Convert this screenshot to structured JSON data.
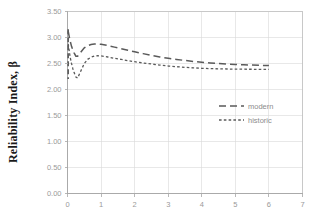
{
  "chart_data": {
    "type": "line",
    "title": "",
    "xlabel": "",
    "ylabel": "Reliability Index, β",
    "xlim": [
      0,
      7
    ],
    "ylim": [
      0.0,
      3.5
    ],
    "grid": true,
    "legend_position": "center-right",
    "xticks": [
      "0",
      "1",
      "2",
      "3",
      "4",
      "5",
      "6",
      "7"
    ],
    "xtick_values": [
      0,
      1,
      2,
      3,
      4,
      5,
      6,
      7
    ],
    "yticks": [
      "0.00",
      "0.50",
      "1.00",
      "1.50",
      "2.00",
      "2.50",
      "3.00",
      "3.50"
    ],
    "ytick_values": [
      0.0,
      0.5,
      1.0,
      1.5,
      2.0,
      2.5,
      3.0,
      3.5
    ],
    "series": [
      {
        "name": "modern",
        "style": "long-dash",
        "color": "#5a5a5a",
        "x": [
          0.02,
          0.05,
          0.08,
          0.12,
          0.16,
          0.2,
          0.25,
          0.3,
          0.4,
          0.5,
          0.6,
          0.7,
          0.8,
          0.9,
          1.0,
          1.2,
          1.4,
          1.6,
          1.8,
          2.0,
          2.25,
          2.5,
          2.75,
          3.0,
          3.25,
          3.5,
          3.75,
          4.0,
          4.25,
          4.5,
          4.75,
          5.0,
          5.25,
          5.5,
          5.75,
          6.0
        ],
        "y": [
          3.12,
          3.02,
          2.93,
          2.83,
          2.76,
          2.7,
          2.64,
          2.64,
          2.72,
          2.8,
          2.84,
          2.865,
          2.875,
          2.875,
          2.87,
          2.845,
          2.815,
          2.785,
          2.755,
          2.725,
          2.69,
          2.655,
          2.625,
          2.6,
          2.578,
          2.558,
          2.54,
          2.525,
          2.512,
          2.5,
          2.49,
          2.482,
          2.475,
          2.47,
          2.465,
          2.46
        ]
      },
      {
        "name": "historic",
        "style": "short-dash",
        "color": "#5a5a5a",
        "x": [
          0.02,
          0.05,
          0.08,
          0.12,
          0.16,
          0.2,
          0.25,
          0.3,
          0.4,
          0.5,
          0.6,
          0.7,
          0.8,
          0.9,
          1.0,
          1.2,
          1.4,
          1.6,
          1.8,
          2.0,
          2.25,
          2.5,
          2.75,
          3.0,
          3.25,
          3.5,
          3.75,
          4.0,
          4.25,
          4.5,
          4.75,
          5.0,
          5.25,
          5.5,
          5.75,
          6.0
        ],
        "y": [
          2.88,
          2.75,
          2.62,
          2.5,
          2.4,
          2.32,
          2.24,
          2.22,
          2.36,
          2.5,
          2.58,
          2.62,
          2.645,
          2.65,
          2.645,
          2.625,
          2.6,
          2.578,
          2.555,
          2.535,
          2.51,
          2.49,
          2.47,
          2.452,
          2.438,
          2.426,
          2.416,
          2.408,
          2.402,
          2.398,
          2.394,
          2.392,
          2.39,
          2.389,
          2.388,
          2.388
        ]
      }
    ],
    "spike": {
      "series": "modern",
      "x": 0.02,
      "y_top": 3.16,
      "y_bottom": 2.2
    }
  },
  "legend": {
    "entries": [
      {
        "label": "modern",
        "style": "long-dash"
      },
      {
        "label": "historic",
        "style": "short-dash"
      }
    ]
  },
  "axes": {
    "y_title": "Reliability Index, β"
  }
}
